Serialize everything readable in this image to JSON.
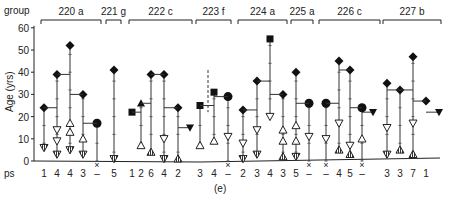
{
  "chart_data": {
    "type": "scatter",
    "title": "",
    "caption": "(e)",
    "xlabel": "ps",
    "ylabel": "Age (yrs)",
    "ylim": [
      0,
      60
    ],
    "yticks": [
      0,
      10,
      20,
      30,
      40,
      50,
      60
    ],
    "group_header_label": "group",
    "marker_legend": {
      "diamond": "filled diamond",
      "square": "filled square",
      "circle": "filled circle",
      "tri_up_filled": "filled upward triangle",
      "tri_down_filled": "filled downward triangle",
      "tri_up_open": "open upward triangle",
      "tri_down_open": "open downward triangle",
      "tri_up_hatched": "hatched upward triangle",
      "tri_down_hatched": "hatched downward triangle"
    },
    "groups": [
      {
        "name": "220 a",
        "x0": 41,
        "x1": 101,
        "columns": [
          {
            "ps": "1",
            "x": 44,
            "points": [
              {
                "m": "diamond",
                "y": 24
              },
              {
                "m": "tri_down_hatched",
                "y": 6
              }
            ]
          },
          {
            "ps": "4",
            "x": 57,
            "points": [
              {
                "m": "diamond",
                "y": 39
              },
              {
                "m": "tri_down_open",
                "y": 14
              },
              {
                "m": "tri_down_open",
                "y": 9
              },
              {
                "m": "tri_down_hatched",
                "y": 3
              }
            ]
          },
          {
            "ps": "4",
            "x": 70,
            "points": [
              {
                "m": "diamond",
                "y": 52
              },
              {
                "m": "tri_up_open",
                "y": 17
              },
              {
                "m": "tri_up_open",
                "y": 13
              },
              {
                "m": "tri_down_hatched",
                "y": 5
              }
            ]
          },
          {
            "ps": "3",
            "x": 83,
            "points": [
              {
                "m": "diamond",
                "y": 30
              },
              {
                "m": "tri_up_open",
                "y": 10
              },
              {
                "m": "tri_down_hatched",
                "y": 3
              }
            ]
          },
          {
            "ps": "–",
            "x": 97,
            "dead": true,
            "points": [
              {
                "m": "circle",
                "y": 17
              }
            ]
          }
        ]
      },
      {
        "name": "221 g",
        "x0": 106,
        "x1": 121,
        "columns": [
          {
            "ps": "5",
            "x": 114,
            "points": [
              {
                "m": "diamond",
                "y": 41
              },
              {
                "m": "tri_down_hatched",
                "y": 1
              }
            ]
          }
        ]
      },
      {
        "name": "222 c",
        "x0": 129,
        "x1": 192,
        "columns": [
          {
            "ps": "1",
            "x": 132,
            "points": [
              {
                "m": "square",
                "y": 22
              }
            ]
          },
          {
            "ps": "2",
            "x": 141,
            "points": [
              {
                "m": "tri_up_filled",
                "y": 26
              },
              {
                "m": "tri_up_open",
                "y": 7
              }
            ]
          },
          {
            "ps": "6",
            "x": 151,
            "points": [
              {
                "m": "diamond",
                "y": 39
              },
              {
                "m": "tri_up_hatched",
                "y": 4
              }
            ]
          },
          {
            "ps": "4",
            "x": 164,
            "points": [
              {
                "m": "diamond",
                "y": 39
              },
              {
                "m": "tri_down_open",
                "y": 10
              },
              {
                "m": "tri_down_hatched",
                "y": 1
              }
            ]
          },
          {
            "ps": "2",
            "x": 178,
            "points": [
              {
                "m": "diamond",
                "y": 24
              },
              {
                "m": "tri_up_hatched",
                "y": 1
              }
            ],
            "side": {
              "m": "tri_down_filled",
              "y": 15,
              "x": 190
            }
          }
        ]
      },
      {
        "name": "223 f",
        "x0": 196,
        "x1": 231,
        "columns": [
          {
            "ps": "3",
            "x": 200,
            "points": [
              {
                "m": "square",
                "y": 25
              },
              {
                "m": "tri_up_open",
                "y": 7
              }
            ]
          },
          {
            "ps": "4",
            "x": 214,
            "points": [
              {
                "m": "square",
                "y": 31
              },
              {
                "m": "tri_up_open",
                "y": 9
              }
            ]
          },
          {
            "ps": "–",
            "x": 228,
            "dead": true,
            "points": [
              {
                "m": "circle",
                "y": 29
              },
              {
                "m": "tri_down_open",
                "y": 11
              }
            ]
          }
        ]
      },
      {
        "name": "224 a",
        "x0": 238,
        "x1": 287,
        "columns": [
          {
            "ps": "2",
            "x": 243,
            "points": [
              {
                "m": "diamond",
                "y": 23
              },
              {
                "m": "tri_down_open",
                "y": 8
              },
              {
                "m": "tri_down_hatched",
                "y": 1
              }
            ]
          },
          {
            "ps": "3",
            "x": 257,
            "points": [
              {
                "m": "diamond",
                "y": 36
              },
              {
                "m": "tri_down_open",
                "y": 14
              },
              {
                "m": "tri_down_hatched",
                "y": 3
              }
            ]
          },
          {
            "ps": "4",
            "x": 270,
            "points": [
              {
                "m": "square",
                "y": 55
              },
              {
                "m": "tri_down_open",
                "y": 20
              }
            ]
          },
          {
            "ps": "3",
            "x": 283,
            "points": [
              {
                "m": "diamond",
                "y": 30
              },
              {
                "m": "tri_up_open",
                "y": 14
              },
              {
                "m": "tri_up_open",
                "y": 9
              },
              {
                "m": "tri_up_hatched",
                "y": 2
              }
            ]
          }
        ]
      },
      {
        "name": "225 a",
        "x0": 291,
        "x1": 313,
        "columns": [
          {
            "ps": "5",
            "x": 296,
            "points": [
              {
                "m": "diamond",
                "y": 40
              },
              {
                "m": "tri_up_open",
                "y": 16
              },
              {
                "m": "tri_up_open",
                "y": 9
              },
              {
                "m": "tri_down_hatched",
                "y": 2
              }
            ]
          },
          {
            "ps": "–",
            "x": 309,
            "dead": true,
            "points": [
              {
                "m": "circle",
                "y": 26
              },
              {
                "m": "tri_down_open",
                "y": 11
              }
            ]
          }
        ]
      },
      {
        "name": "226 c",
        "x0": 319,
        "x1": 380,
        "columns": [
          {
            "ps": "–",
            "x": 326,
            "dead": true,
            "points": [
              {
                "m": "circle",
                "y": 26
              },
              {
                "m": "tri_down_open",
                "y": 10
              }
            ]
          },
          {
            "ps": "4",
            "x": 339,
            "points": [
              {
                "m": "diamond",
                "y": 45
              },
              {
                "m": "tri_down_open",
                "y": 17
              },
              {
                "m": "tri_up_hatched",
                "y": 5
              }
            ]
          },
          {
            "ps": "5",
            "x": 350,
            "points": [
              {
                "m": "diamond",
                "y": 41
              },
              {
                "m": "tri_down_open",
                "y": 7
              },
              {
                "m": "tri_up_hatched",
                "y": 3
              }
            ]
          },
          {
            "ps": "–",
            "x": 362,
            "dead": true,
            "points": [
              {
                "m": "circle",
                "y": 24
              },
              {
                "m": "tri_up_open",
                "y": 10
              }
            ],
            "side": {
              "m": "tri_down_filled",
              "y": 22,
              "x": 373
            }
          }
        ]
      },
      {
        "name": "227 b",
        "x0": 383,
        "x1": 441,
        "columns": [
          {
            "ps": "3",
            "x": 387,
            "points": [
              {
                "m": "diamond",
                "y": 35
              },
              {
                "m": "tri_down_open",
                "y": 15
              },
              {
                "m": "tri_down_hatched",
                "y": 3
              }
            ]
          },
          {
            "ps": "3",
            "x": 400,
            "points": [
              {
                "m": "diamond",
                "y": 32
              },
              {
                "m": "tri_up_hatched",
                "y": 5
              }
            ]
          },
          {
            "ps": "7",
            "x": 413,
            "points": [
              {
                "m": "diamond",
                "y": 47
              },
              {
                "m": "tri_down_open",
                "y": 17
              },
              {
                "m": "tri_up_hatched",
                "y": 3
              }
            ]
          },
          {
            "ps": "1",
            "x": 426,
            "points": [
              {
                "m": "diamond",
                "y": 27
              }
            ],
            "side": {
              "m": "tri_down_filled",
              "y": 22,
              "x": 439
            }
          }
        ]
      }
    ]
  },
  "figure": {
    "group_label": "group",
    "ps_label": "ps",
    "y_axis_label": "Age (yrs)",
    "caption": "(e)"
  }
}
